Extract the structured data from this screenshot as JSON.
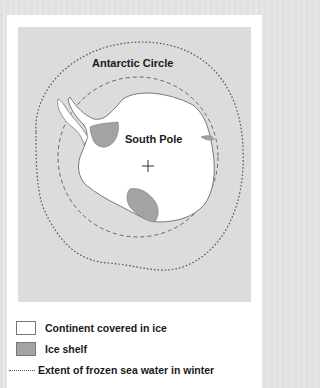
{
  "map": {
    "labels": {
      "antarctic_circle": "Antarctic Circle",
      "south_pole": "South Pole"
    },
    "colors": {
      "sea": "#dcdcdc",
      "continent": "#ffffff",
      "ice_shelf": "#a3a3a3",
      "lines": "#555555"
    }
  },
  "legend": {
    "items": [
      {
        "symbol": "white-box",
        "label": "Continent covered in ice"
      },
      {
        "symbol": "gray-box",
        "label": "Ice shelf"
      },
      {
        "symbol": "dotted-line",
        "label": "Extent of frozen sea water in winter"
      }
    ]
  }
}
